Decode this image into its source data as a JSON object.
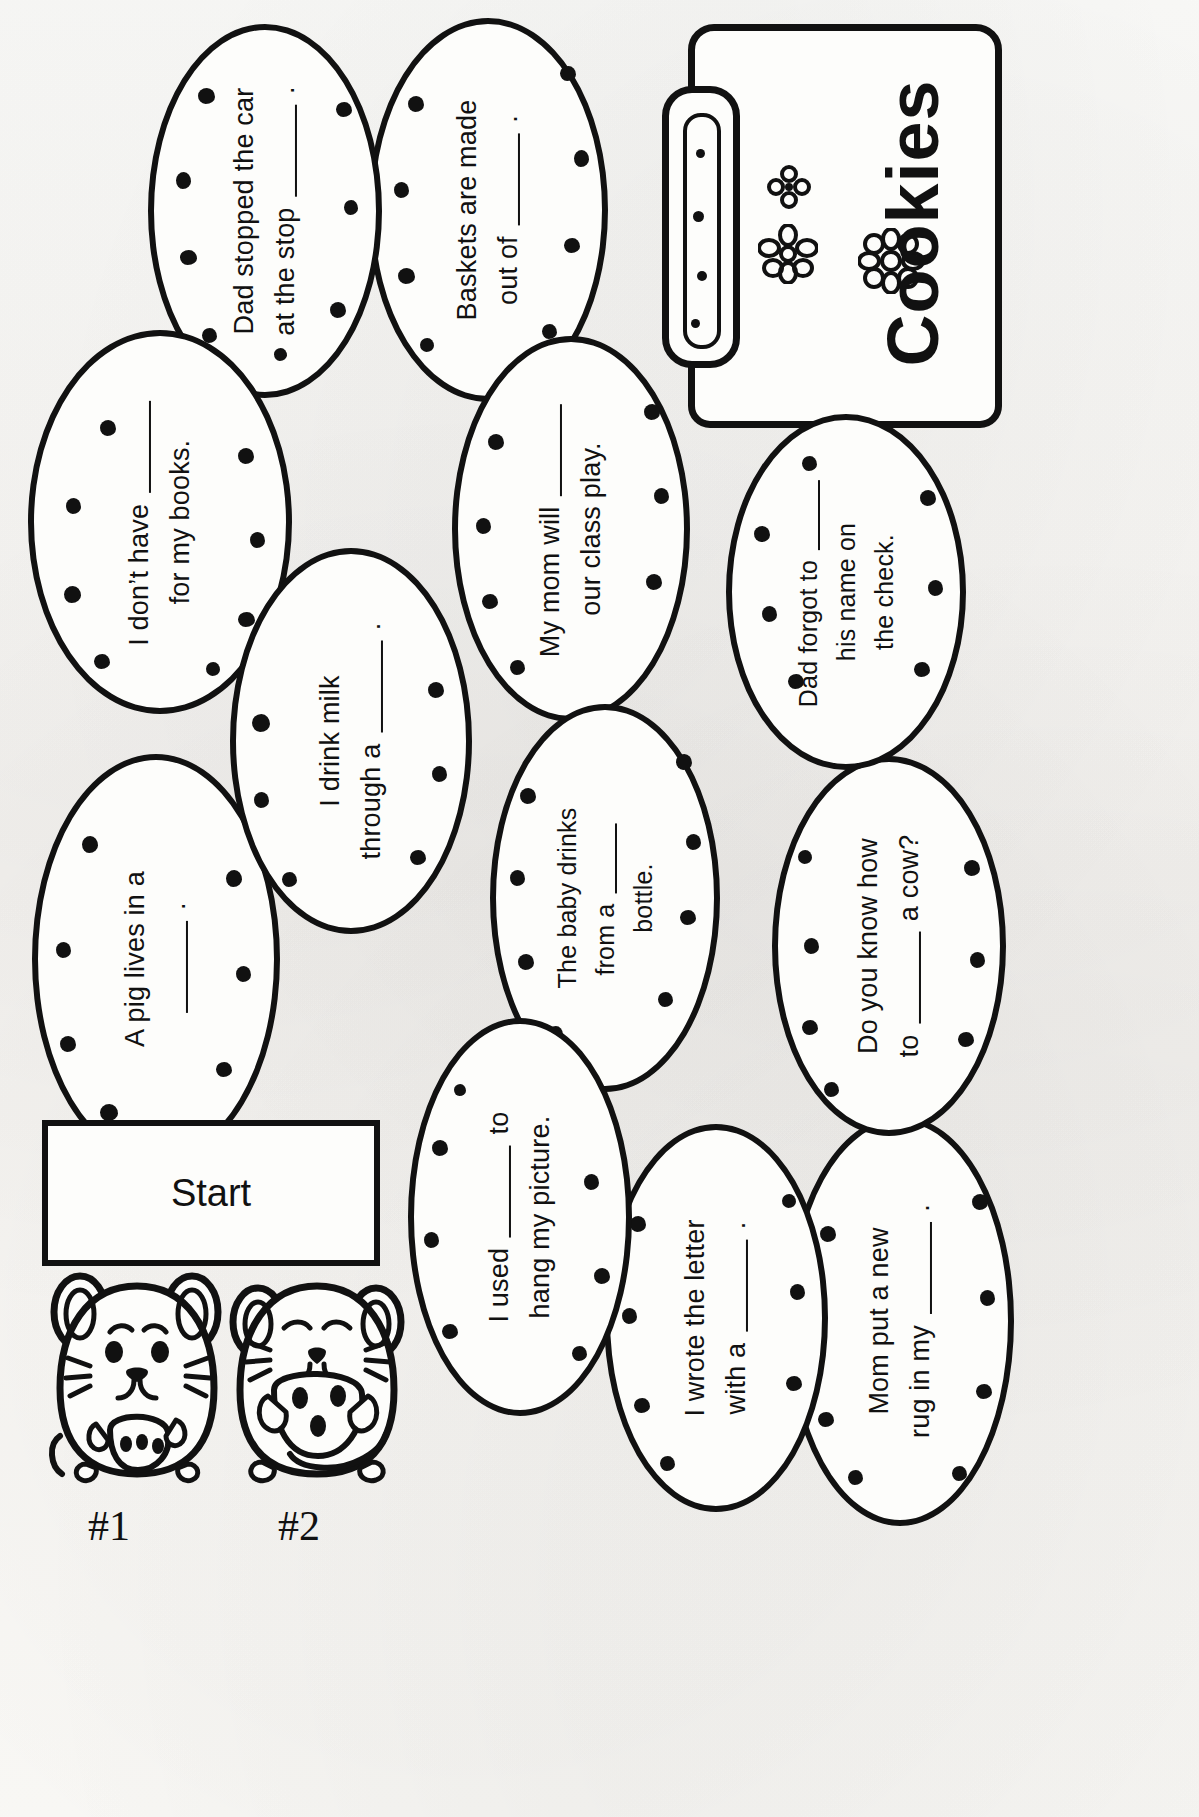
{
  "worksheet": {
    "title": "Chocolate Chip Cookie Sentence Path Worksheet",
    "start_label": "Start",
    "jar_label": "Cookies"
  },
  "cookies": [
    {
      "id": "cookie-dad-stopped",
      "lines": [
        "Dad stopped the car",
        "at the stop ____ ."
      ]
    },
    {
      "id": "cookie-baskets",
      "lines": [
        "Baskets are made",
        "out of ____ ."
      ]
    },
    {
      "id": "cookie-dont-have",
      "lines": [
        "I don’t have ____",
        "for my books."
      ]
    },
    {
      "id": "cookie-mom-play",
      "lines": [
        "My mom will ____",
        "our class play."
      ]
    },
    {
      "id": "cookie-dad-forgot",
      "lines": [
        "Dad forgot to ____",
        "his name on",
        "the check."
      ]
    },
    {
      "id": "cookie-drink-milk",
      "lines": [
        "I drink milk",
        "through a ____ ."
      ]
    },
    {
      "id": "cookie-pig",
      "lines": [
        "A pig lives in a",
        "____ ."
      ]
    },
    {
      "id": "cookie-baby",
      "lines": [
        "The baby drinks",
        "from a ____",
        "bottle."
      ]
    },
    {
      "id": "cookie-cow",
      "lines": [
        "Do you know how",
        "to ____ a cow?"
      ]
    },
    {
      "id": "cookie-used-hang",
      "lines": [
        "I used ____ to",
        "hang my picture."
      ]
    },
    {
      "id": "cookie-wrote",
      "lines": [
        "I wrote the letter",
        "with a ____ ."
      ]
    },
    {
      "id": "cookie-rug",
      "lines": [
        "Mom put a new",
        "rug in my ____ ."
      ]
    }
  ],
  "mice": [
    {
      "id": "mouse-1",
      "number": "#1"
    },
    {
      "id": "mouse-2",
      "number": "#2"
    }
  ]
}
